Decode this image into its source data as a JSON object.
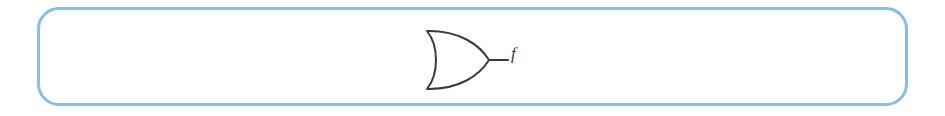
{
  "figure": {
    "background_color": "#ffffff",
    "panel": {
      "border_color": "#86bdeb",
      "border_width_px": 3,
      "corner_radius_px": 22
    },
    "diagram": {
      "type": "logic-gate-schematic",
      "stroke_color": "#3a3a3a",
      "stroke_width_px": 2,
      "gates": [
        {
          "id": "gate-1",
          "gate_type": "OR",
          "symbol_style": "distinctive-shape",
          "inputs": [],
          "inverted_output": false,
          "output_label": "f"
        }
      ],
      "wires": [
        {
          "id": "output-wire",
          "from": "gate-1.output",
          "to": "label-f"
        }
      ],
      "labels": [
        {
          "id": "label-f",
          "text": "f",
          "style": "italic-serif",
          "color": "#3a3a3a"
        }
      ]
    }
  }
}
